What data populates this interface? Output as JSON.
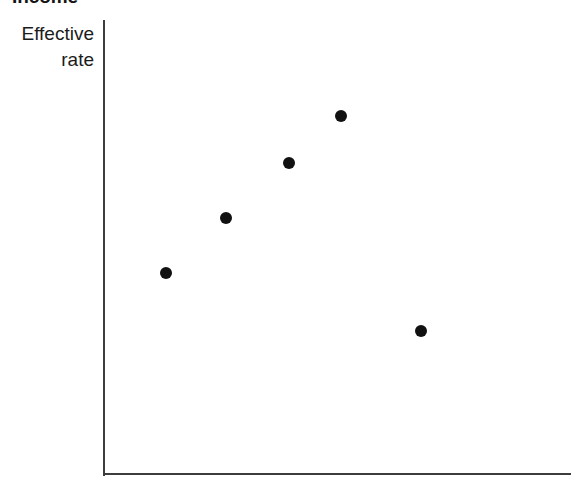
{
  "chart_data": {
    "type": "scatter",
    "title": "Income",
    "title_clipped": true,
    "xlabel": "",
    "ylabel": "Effective rate",
    "ylabel_lines": [
      "Effective",
      "rate"
    ],
    "grid": false,
    "legend": null,
    "axis_ticks": {
      "x": [],
      "y": []
    },
    "xlim": [
      0,
      100
    ],
    "ylim": [
      0,
      100
    ],
    "marker": {
      "shape": "circle",
      "color": "#111111",
      "size_px": 12
    },
    "axis_color": "#3d3d3d",
    "background_color": "#ffffff",
    "points": [
      {
        "label": "point-1",
        "x": 13.0,
        "y": 44.2
      },
      {
        "label": "point-2",
        "x": 26.0,
        "y": 56.3
      },
      {
        "label": "point-3",
        "x": 39.5,
        "y": 68.4
      },
      {
        "label": "point-4",
        "x": 50.6,
        "y": 78.8
      },
      {
        "label": "point-5",
        "x": 67.8,
        "y": 31.4
      }
    ]
  }
}
